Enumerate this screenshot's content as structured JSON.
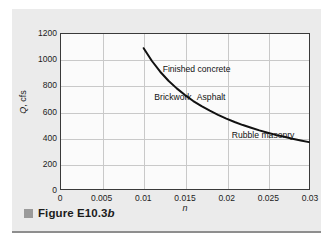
{
  "figure": {
    "caption_prefix": "Figure E10.3",
    "caption_suffix": "b",
    "bullet_color": "#9a9a9a"
  },
  "chart_data": {
    "type": "line",
    "title": "",
    "xlabel": "n",
    "ylabel": "Q, cfs",
    "ylabel_italic_part": "Q",
    "ylabel_rest": ", cfs",
    "xlim": [
      0,
      0.03
    ],
    "ylim": [
      0,
      1200
    ],
    "grid": true,
    "legend_position": "none",
    "line_color": "#111111",
    "plot_bg_color": "#fbfbfb",
    "grid_color": "#c9c9c9",
    "axis_color": "#3a3a3a",
    "xticks": [
      0,
      0.005,
      0.01,
      0.015,
      0.02,
      0.025,
      0.03
    ],
    "xtick_labels": [
      "0",
      "0.005",
      "0.01",
      "0.015",
      "0.02",
      "0.025",
      "0.03"
    ],
    "yticks": [
      0,
      200,
      400,
      600,
      800,
      1000,
      1200
    ],
    "ytick_labels": [
      "0",
      "200",
      "400",
      "600",
      "800",
      "1000",
      "1200"
    ],
    "series": [
      {
        "name": "Q vs n",
        "relation": "Q = 10.9 / n",
        "x": [
          0.01,
          0.011,
          0.012,
          0.013,
          0.014,
          0.015,
          0.016,
          0.017,
          0.018,
          0.019,
          0.02,
          0.021,
          0.022,
          0.023,
          0.024,
          0.025,
          0.026,
          0.027,
          0.028,
          0.029,
          0.03
        ],
        "values": [
          1090,
          991,
          908,
          838,
          779,
          727,
          681,
          641,
          606,
          574,
          545,
          519,
          495,
          474,
          454,
          436,
          419,
          404,
          389,
          376,
          363
        ]
      }
    ],
    "annotations": [
      {
        "text": "Finished concrete",
        "x": 0.0122,
        "y": 930
      },
      {
        "text": "Brickwork",
        "x": 0.0112,
        "y": 715
      },
      {
        "text": "Asphalt",
        "x": 0.0163,
        "y": 715
      },
      {
        "text": "Rubble masonry",
        "x": 0.0205,
        "y": 430
      }
    ]
  }
}
